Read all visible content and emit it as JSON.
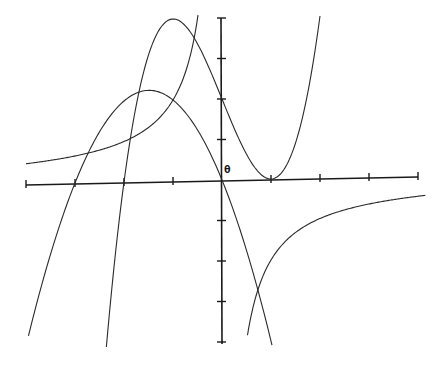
{
  "chart_data": {
    "type": "line",
    "title": "",
    "xlabel": "",
    "ylabel": "",
    "origin_label": "θ",
    "xlim": [
      -4,
      4
    ],
    "ylim": [
      -4,
      4
    ],
    "x_ticks": [
      -4,
      -3,
      -2,
      -1,
      0,
      1,
      2,
      3,
      4
    ],
    "y_ticks": [
      -4,
      -3,
      -2,
      -1,
      0,
      1,
      2,
      3,
      4
    ],
    "tick_labels_shown": false,
    "grid": false,
    "legend": null,
    "series": [
      {
        "name": "cubic",
        "formula": "y = x^3 - 3x + 2",
        "coeffs": [
          1,
          0,
          -3,
          2
        ],
        "kind": "poly",
        "domain": [
          -2.36,
          2.0
        ],
        "points": [
          [
            -2.36,
            -4.07
          ],
          [
            -2,
            0
          ],
          [
            -1,
            4
          ],
          [
            0,
            2
          ],
          [
            1,
            0
          ],
          [
            2,
            4
          ]
        ]
      },
      {
        "name": "parabola",
        "formula": "y = -x^2 - 3x",
        "coeffs": [
          -1,
          -3,
          0
        ],
        "kind": "poly",
        "domain": [
          -3.95,
          1.02
        ],
        "points": [
          [
            -3.95,
            -3.75
          ],
          [
            -3,
            0
          ],
          [
            -1.5,
            2.25
          ],
          [
            0,
            0
          ],
          [
            1,
            -4
          ]
        ]
      },
      {
        "name": "hyperbola-left",
        "formula": "y = -2/x",
        "kind": "recip",
        "k": -2,
        "domain": [
          -4,
          -0.49
        ],
        "points": [
          [
            -4,
            0.5
          ],
          [
            -2,
            1
          ],
          [
            -1,
            2
          ],
          [
            -0.5,
            4
          ]
        ]
      },
      {
        "name": "hyperbola-right",
        "formula": "y = -2/x",
        "kind": "recip",
        "k": -2,
        "domain": [
          0.52,
          4.15
        ],
        "points": [
          [
            0.5,
            -4
          ],
          [
            1,
            -2
          ],
          [
            2,
            -1
          ],
          [
            4,
            -0.5
          ]
        ]
      }
    ]
  },
  "layout": {
    "origin_px": [
      222,
      180
    ],
    "x_unit_px": 49,
    "y_unit_px": 40.5,
    "x_axis": {
      "left": [
        26,
        185
      ],
      "right": [
        418,
        177
      ]
    },
    "y_axis": {
      "top": [
        221,
        18
      ],
      "bottom": [
        222,
        344
      ]
    },
    "colors": {
      "axis": "#1a1a1a",
      "curve": "#2a2a2a",
      "background": "#ffffff"
    }
  }
}
